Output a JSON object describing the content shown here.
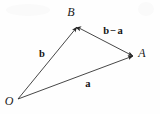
{
  "figure": {
    "type": "vector-triangle-diagram",
    "background_color": "#fefefe",
    "stroke_color": "#262626",
    "width": 160,
    "height": 114,
    "points": [
      {
        "name": "O",
        "label": "O",
        "x": 18,
        "y": 99,
        "label_x": 9,
        "label_y": 101
      },
      {
        "name": "B",
        "label": "B",
        "x": 77,
        "y": 27,
        "label_x": 71,
        "label_y": 12
      },
      {
        "name": "A",
        "label": "A",
        "x": 133,
        "y": 56,
        "label_x": 142,
        "label_y": 53
      }
    ],
    "vectors": [
      {
        "name": "b",
        "label": "b",
        "from": "O",
        "to": "B",
        "x1": 18,
        "y1": 99,
        "x2": 77,
        "y2": 27,
        "arrowhead": "end",
        "label_x": 42,
        "label_y": 54
      },
      {
        "name": "a",
        "label": "a",
        "from": "O",
        "to": "A",
        "x1": 18,
        "y1": 99,
        "x2": 133,
        "y2": 56,
        "arrowhead": "end",
        "label_x": 88,
        "label_y": 84
      },
      {
        "name": "b-minus-a",
        "label_lhs": "b",
        "label_op": "−",
        "label_rhs": "a",
        "from": "B",
        "to": "A",
        "x1": 77,
        "y1": 27,
        "x2": 133,
        "y2": 56,
        "arrowhead": "both",
        "label_x": 113,
        "label_y": 31
      }
    ]
  }
}
